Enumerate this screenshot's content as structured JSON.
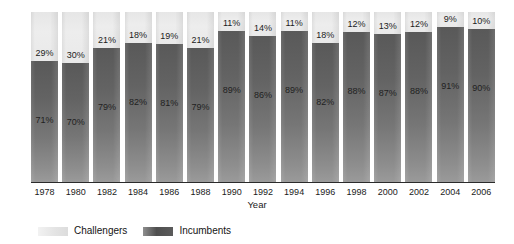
{
  "chart_data": {
    "type": "bar",
    "subtype": "stacked-bar-100-percent",
    "title": "",
    "xlabel": "Year",
    "ylabel": "",
    "ylim": [
      0,
      100
    ],
    "grid": false,
    "legend_position": "bottom-left",
    "categories": [
      "1978",
      "1980",
      "1982",
      "1984",
      "1986",
      "1988",
      "1990",
      "1992",
      "1994",
      "1996",
      "1998",
      "2000",
      "2002",
      "2004",
      "2006"
    ],
    "series": [
      {
        "name": "Challengers",
        "color": "#e9e9e9",
        "values": [
          29,
          30,
          21,
          18,
          19,
          21,
          11,
          14,
          11,
          18,
          12,
          13,
          12,
          9,
          10
        ],
        "labels": [
          "29%",
          "30%",
          "21%",
          "18%",
          "19%",
          "21%",
          "11%",
          "14%",
          "11%",
          "18%",
          "12%",
          "13%",
          "12%",
          "9%",
          "10%"
        ]
      },
      {
        "name": "Incumbents",
        "color": "#636363",
        "values": [
          71,
          70,
          79,
          82,
          81,
          79,
          89,
          86,
          89,
          82,
          88,
          87,
          88,
          91,
          90
        ],
        "labels": [
          "71%",
          "70%",
          "79%",
          "82%",
          "81%",
          "79%",
          "89%",
          "86%",
          "89%",
          "82%",
          "88%",
          "87%",
          "88%",
          "91%",
          "90%"
        ]
      }
    ]
  },
  "axis": {
    "x_title": "Year",
    "tick_labels": [
      "1978",
      "1980",
      "1982",
      "1984",
      "1986",
      "1988",
      "1990",
      "1992",
      "1994",
      "1996",
      "1998",
      "2000",
      "2002",
      "2004",
      "2006"
    ]
  },
  "legend": {
    "items": [
      {
        "label": "Challengers",
        "color": "#e9e9e9"
      },
      {
        "label": "Incumbents",
        "color": "#636363"
      }
    ]
  }
}
